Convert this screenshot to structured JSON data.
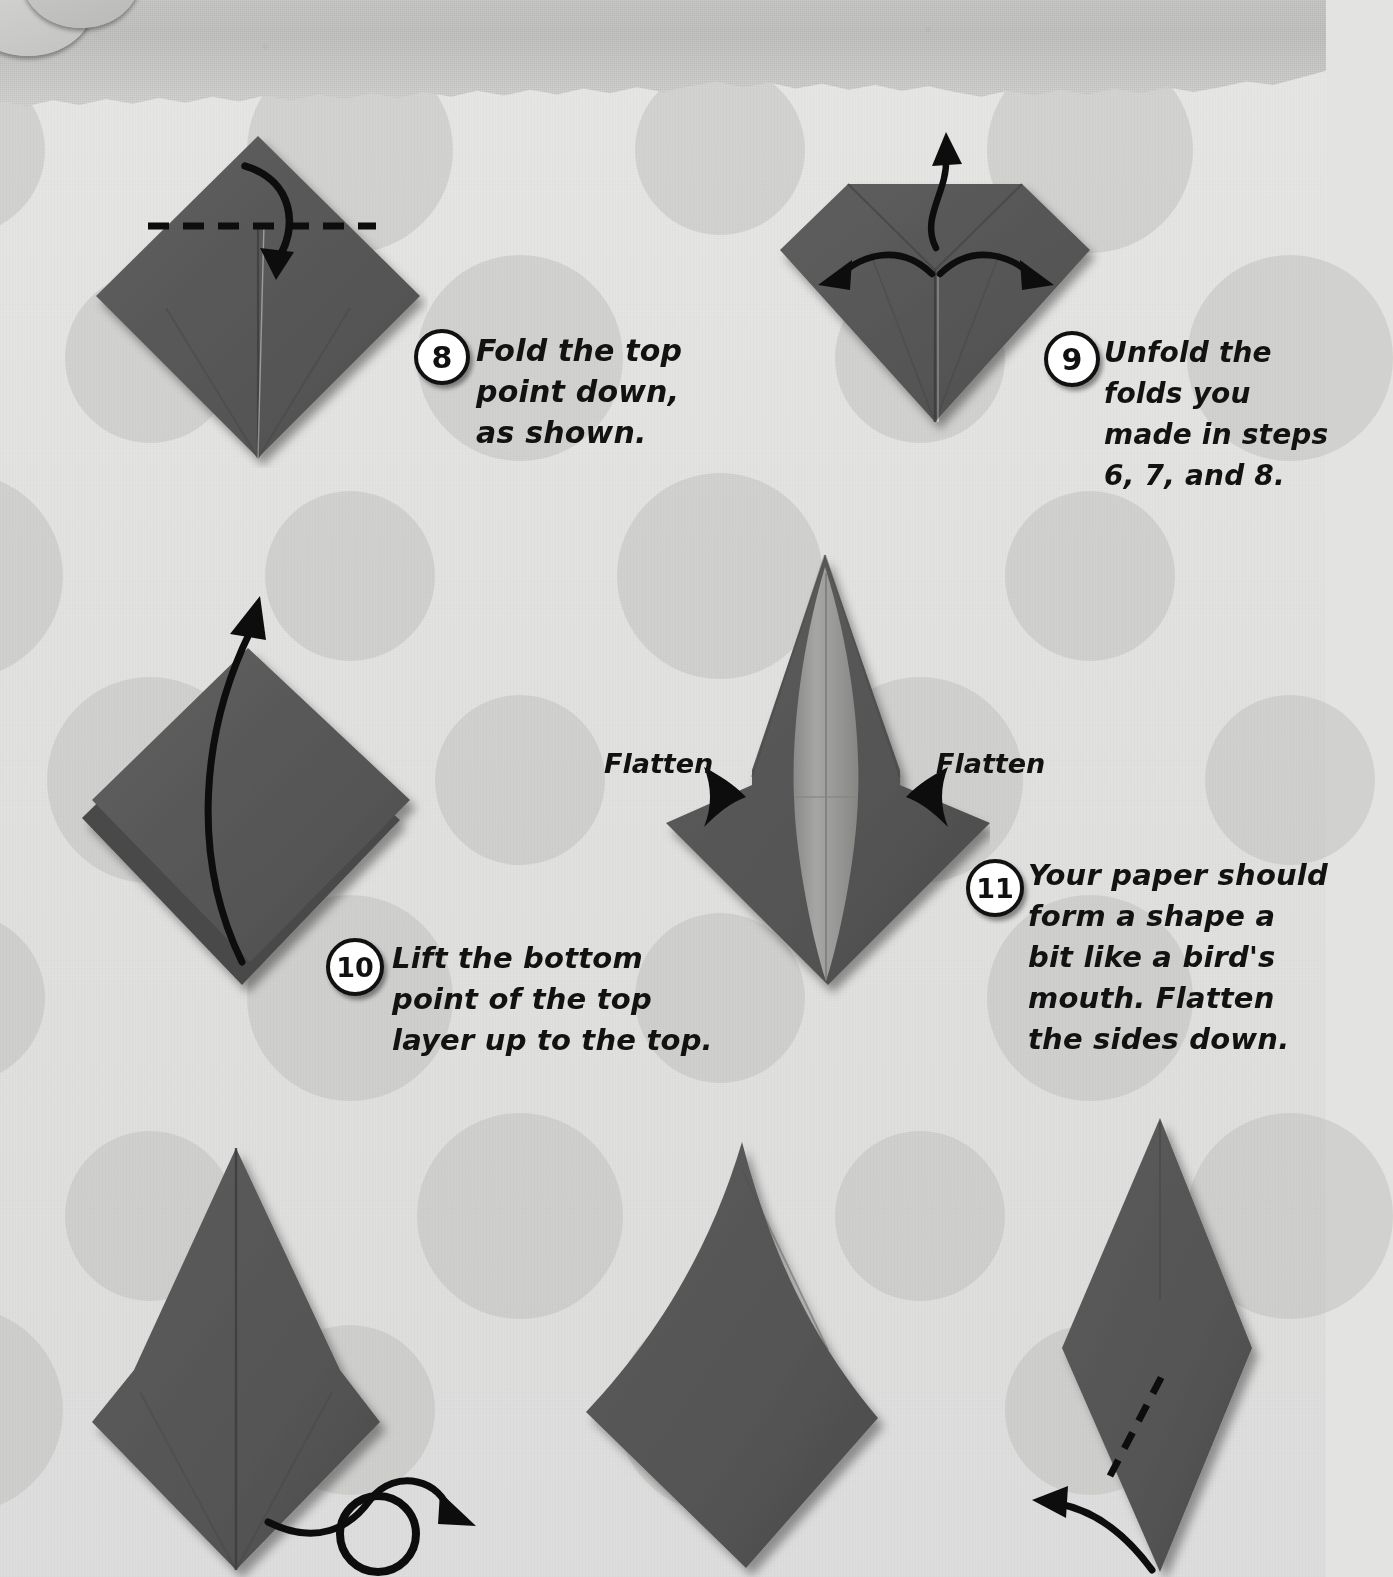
{
  "page": {
    "background_color": "#e3e3e1",
    "paper_color": "#585858",
    "paper_light_color": "#9d9d9b",
    "ink_color": "#111111",
    "torn_strip_color": "#c6c6c4"
  },
  "steps": [
    {
      "number": "8",
      "lines": [
        "Fold the top",
        "point down,",
        "as shown."
      ],
      "diagram": "square-diamond-with-horizontal-dashed-fold-line-and-down-arrow"
    },
    {
      "number": "9",
      "lines": [
        "Unfold the",
        "folds you",
        "made in steps",
        "6, 7, and 8."
      ],
      "diagram": "gem-shape-with-up-left-and-right-unfold-arrows"
    },
    {
      "number": "10",
      "lines": [
        "Lift the bottom",
        "point of the top",
        "layer up to the top."
      ],
      "diagram": "layered-diamond-with-tall-lift-arrow"
    },
    {
      "number": "11",
      "lines": [
        "Your paper should",
        "form a shape a",
        "bit like a bird's",
        "mouth. Flatten",
        "the sides down."
      ],
      "diagram": "birds-mouth-shape-with-flatten-arrows"
    }
  ],
  "annotations": {
    "flatten_left": "Flatten",
    "flatten_right": "Flatten"
  },
  "bottom_figures": [
    {
      "name": "kite-shape-with-turn-over-arrow"
    },
    {
      "name": "plain-dark-kite-shape"
    },
    {
      "name": "narrow-diamond-with-dashed-fold-and-left-arrow"
    }
  ]
}
